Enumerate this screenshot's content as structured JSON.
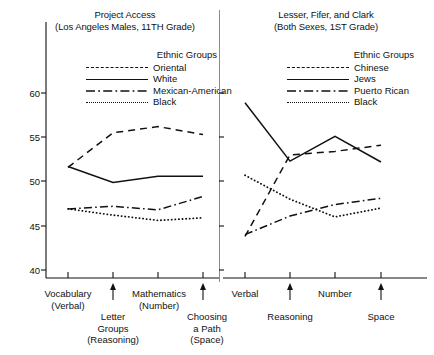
{
  "figure": {
    "y_axis": {
      "ticks": [
        40,
        45,
        50,
        55,
        60
      ],
      "min": 38.2,
      "max": 63.5
    },
    "panels": [
      {
        "id": "project-access",
        "title_line1": "Project Access",
        "title_line2": "(Los Angeles Males, 11TH Grade)",
        "legend_title": "Ethnic Groups",
        "legend": [
          {
            "label": "Oriental",
            "style": "dashed"
          },
          {
            "label": "White",
            "style": "solid"
          },
          {
            "label": "Mexican-American",
            "style": "dashdot"
          },
          {
            "label": "Black",
            "style": "dotted"
          }
        ],
        "x_categories": [
          "Vocabulary",
          "Letter Groups",
          "Mathematics",
          "Choosing a Path"
        ],
        "x_sub_labels": [
          "(Verbal)",
          "(Reasoning)",
          "(Number)",
          "(Space)"
        ],
        "x_axis_upper_labels": [
          "Vocabulary\n(Verbal)",
          "Mathematics\n(Number)"
        ],
        "x_axis_lower_labels": [
          "Letter\nGroups\n(Reasoning)",
          "Choosing\na Path\n(Space)"
        ]
      },
      {
        "id": "lesser-fifer-clark",
        "title_line1": "Lesser, Fifer, and Clark",
        "title_line2": "(Both Sexes, 1ST Grade)",
        "legend_title": "Ethnic Groups",
        "legend": [
          {
            "label": "Chinese",
            "style": "dashed"
          },
          {
            "label": "Jews",
            "style": "solid"
          },
          {
            "label": "Puerto Rican",
            "style": "dashdot"
          },
          {
            "label": "Black",
            "style": "dotted"
          }
        ],
        "x_categories": [
          "Verbal",
          "Reasoning",
          "Number",
          "Space"
        ],
        "x_axis_upper_labels": [
          "Verbal",
          "Number"
        ],
        "x_axis_lower_labels": [
          "Reasoning",
          "Space"
        ]
      }
    ]
  },
  "chart_data": [
    {
      "type": "line",
      "title": "Project Access (Los Angeles Males, 11TH Grade)",
      "xlabel": "",
      "ylabel": "",
      "ylim": [
        38.2,
        63.5
      ],
      "yticks": [
        40,
        45,
        50,
        55,
        60
      ],
      "grid": false,
      "legend": "Ethnic Groups",
      "legend_position": "top-right",
      "categories": [
        "Vocabulary (Verbal)",
        "Letter Groups (Reasoning)",
        "Mathematics (Number)",
        "Choosing a Path (Space)"
      ],
      "series": [
        {
          "name": "Oriental",
          "style": "dashed",
          "values": [
            51.6,
            55.5,
            56.2,
            55.3
          ]
        },
        {
          "name": "White",
          "style": "solid",
          "values": [
            51.7,
            49.9,
            50.6,
            50.6
          ]
        },
        {
          "name": "Mexican-American",
          "style": "dash-dot",
          "values": [
            46.9,
            47.2,
            46.8,
            48.3
          ]
        },
        {
          "name": "Black",
          "style": "dotted",
          "values": [
            46.9,
            46.2,
            45.6,
            45.9
          ]
        }
      ]
    },
    {
      "type": "line",
      "title": "Lesser, Fifer, and Clark (Both Sexes, 1ST Grade)",
      "xlabel": "",
      "ylabel": "",
      "ylim": [
        38.2,
        63.5
      ],
      "yticks": [
        40,
        45,
        50,
        55,
        60
      ],
      "grid": false,
      "legend": "Ethnic Groups",
      "legend_position": "top-right",
      "categories": [
        "Verbal",
        "Reasoning",
        "Number",
        "Space"
      ],
      "series": [
        {
          "name": "Chinese",
          "style": "dashed",
          "values": [
            43.8,
            53.0,
            53.4,
            54.1
          ]
        },
        {
          "name": "Jews",
          "style": "solid",
          "values": [
            58.9,
            52.3,
            55.1,
            52.2
          ]
        },
        {
          "name": "Puerto Rican",
          "style": "dash-dot",
          "values": [
            44.0,
            46.1,
            47.4,
            48.1
          ]
        },
        {
          "name": "Black",
          "style": "dotted",
          "values": [
            50.7,
            48.0,
            46.0,
            47.0
          ]
        }
      ]
    }
  ]
}
